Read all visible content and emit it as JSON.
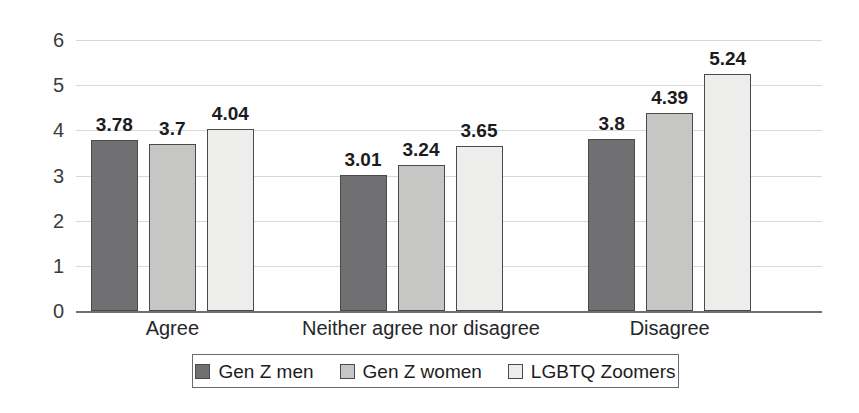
{
  "chart_data": {
    "type": "bar",
    "title": "",
    "subtitle": "",
    "xlabel": "",
    "ylabel": "",
    "ylim": [
      0,
      6
    ],
    "yticks": [
      "0",
      "1",
      "2",
      "3",
      "4",
      "5",
      "6"
    ],
    "grid": true,
    "legend_position": "bottom",
    "categories": [
      "Agree",
      "Neither agree nor disagree",
      "Disagree"
    ],
    "series": [
      {
        "name": "Gen Z men",
        "color": "#707072",
        "values": [
          3.78,
          3.01,
          3.8
        ],
        "labels": [
          "3.78",
          "3.01",
          "3.8"
        ]
      },
      {
        "name": "Gen Z women",
        "color": "#c6c6c4",
        "values": [
          3.7,
          3.24,
          4.39
        ],
        "labels": [
          "3.7",
          "3.24",
          "4.39"
        ]
      },
      {
        "name": "LGBTQ Zoomers",
        "color": "#ededeb",
        "values": [
          4.04,
          3.65,
          5.24
        ],
        "labels": [
          "4.04",
          "3.65",
          "5.24"
        ]
      }
    ]
  }
}
